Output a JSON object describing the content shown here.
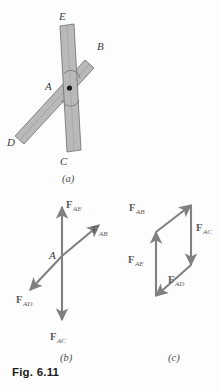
{
  "figure": {
    "caption": "Fig. 6.11",
    "parts": [
      {
        "key": "a",
        "label": "(a)",
        "title": "pin-joint-assembly"
      },
      {
        "key": "b",
        "label": "(b)",
        "title": "free-body-diagram-at-A"
      },
      {
        "key": "c",
        "label": "(c)",
        "title": "force-polygon"
      }
    ]
  },
  "panel_a": {
    "label": "(a)",
    "joint_label": "A",
    "members": {
      "vertical": {
        "top_label": "E",
        "bottom_label": "C"
      },
      "diagonal": {
        "upper_label": "B",
        "lower_label": "D"
      }
    },
    "point_labels": [
      "E",
      "B",
      "A",
      "D",
      "C"
    ]
  },
  "panel_b": {
    "label": "(b)",
    "origin_label": "A",
    "forces": [
      {
        "name": "F_AE",
        "main": "F",
        "sub": "AE",
        "direction": "up"
      },
      {
        "name": "F_AB",
        "main": "F",
        "sub": "AB",
        "direction": "up-right"
      },
      {
        "name": "F_AD",
        "main": "F",
        "sub": "AD",
        "direction": "down-left"
      },
      {
        "name": "F_AC",
        "main": "F",
        "sub": "AC",
        "direction": "down"
      }
    ]
  },
  "panel_c": {
    "label": "(c)",
    "forces": [
      {
        "name": "F_AB",
        "main": "F",
        "sub": "AB",
        "direction": "up-right"
      },
      {
        "name": "F_AC",
        "main": "F",
        "sub": "AC",
        "direction": "down"
      },
      {
        "name": "F_AD",
        "main": "F",
        "sub": "AD",
        "direction": "down-left"
      },
      {
        "name": "F_AE",
        "main": "F",
        "sub": "AE",
        "direction": "up"
      }
    ]
  },
  "colors": {
    "background": "#fdfdfd",
    "member_fill": "#b9b9b9",
    "member_stroke": "#6d6d6d",
    "arrow": "#808080",
    "label_text": "#3c3c3c",
    "caption_text": "#1b1b1b"
  }
}
